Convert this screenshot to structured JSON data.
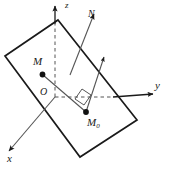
{
  "figure": {
    "background_color": "#ffffff",
    "stroke_color": "#1a1a1a",
    "axes": [
      {
        "id": "z",
        "label": "z",
        "direction": "up",
        "style": "solid-above-dashed-below"
      },
      {
        "id": "y",
        "label": "y",
        "direction": "right",
        "style": "solid-outside-dashed-inside"
      },
      {
        "id": "x",
        "label": "x",
        "direction": "down-left",
        "style": "solid"
      }
    ],
    "origin_label": "O",
    "points": [
      {
        "id": "M",
        "label": "M",
        "marker": "filled-dot"
      },
      {
        "id": "M0",
        "label": "M",
        "subscript": "0",
        "marker": "filled-dot"
      }
    ],
    "vectors": [
      {
        "id": "N",
        "label": "N",
        "description": "plane normal vector"
      },
      {
        "id": "n",
        "label": "",
        "description": "short normal arrow at M0"
      }
    ],
    "segments": [
      {
        "id": "M-to-M0",
        "from": "M",
        "to": "M0",
        "style": "solid"
      }
    ],
    "markers": [
      {
        "id": "right-angle",
        "label": "",
        "description": "right angle square at M0"
      }
    ],
    "plane": {
      "id": "plane",
      "shape": "parallelogram",
      "description": "tilted plane through origin"
    }
  }
}
